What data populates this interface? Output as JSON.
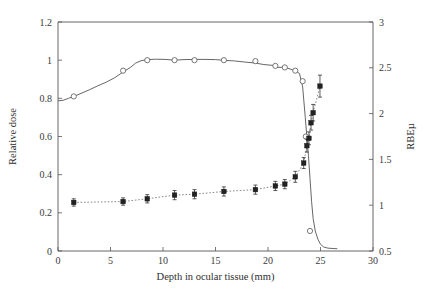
{
  "chart_data": {
    "type": "line",
    "title": "",
    "xlabel": "Depth in ocular tissue (mm)",
    "ylabel": "Relative dose",
    "y2label": "RBEµ",
    "xlim": [
      0,
      30
    ],
    "ylim": [
      0,
      1.2
    ],
    "y2lim": [
      0.5,
      3
    ],
    "xticks": [
      0,
      5,
      10,
      15,
      20,
      25,
      30
    ],
    "xticklabels": [
      "0",
      "5",
      "10",
      "15",
      "20",
      "25",
      "30"
    ],
    "yticks": [
      0,
      0.2,
      0.4,
      0.6,
      0.8,
      1,
      1.2
    ],
    "yticklabels": [
      "0",
      "0.2",
      "0.4",
      "0.6",
      "0.8",
      "1",
      "1.2"
    ],
    "y2ticks": [
      0.5,
      1,
      1.5,
      2,
      2.5,
      3
    ],
    "y2ticklabels": [
      "0.5",
      "1",
      "1.5",
      "2",
      "2.5",
      "3"
    ],
    "grid": false,
    "legend": "none",
    "series": [
      {
        "name": "Relative depth dose (SOBP)",
        "axis": "left",
        "style": "solid-line",
        "marker": "open-circle",
        "x": [
          0.0,
          0.5,
          1.0,
          1.6,
          2.2,
          3.0,
          3.8,
          4.6,
          5.4,
          6.2,
          6.9,
          7.4,
          7.9,
          8.5,
          9.3,
          10.2,
          11.1,
          12.0,
          13.0,
          14.0,
          15.0,
          15.8,
          16.8,
          17.8,
          18.8,
          19.6,
          20.4,
          20.9,
          21.6,
          22.2,
          22.6,
          23.0,
          23.3,
          23.55,
          23.7,
          23.85,
          24.0,
          24.15,
          24.3,
          24.5,
          24.75,
          25.0,
          25.3,
          25.7,
          26.2,
          26.6
        ],
        "y": [
          0.787,
          0.79,
          0.8,
          0.812,
          0.826,
          0.845,
          0.866,
          0.885,
          0.908,
          0.938,
          0.962,
          0.985,
          0.997,
          1.003,
          1.005,
          1.004,
          1.0,
          1.003,
          1.004,
          1.004,
          1.003,
          0.999,
          0.996,
          0.99,
          0.985,
          0.977,
          0.973,
          0.962,
          0.963,
          0.952,
          0.944,
          0.93,
          0.86,
          0.7,
          0.6,
          0.5,
          0.38,
          0.26,
          0.17,
          0.105,
          0.062,
          0.035,
          0.021,
          0.015,
          0.013,
          0.012
        ],
        "marker_x": [
          1.5,
          6.2,
          8.5,
          11.1,
          13.0,
          15.8,
          18.8,
          20.7,
          21.6,
          22.6,
          23.3,
          23.6,
          24.0
        ],
        "marker_y": [
          0.81,
          0.945,
          1.0,
          1.0,
          1.0,
          1.0,
          0.995,
          0.97,
          0.962,
          0.945,
          0.89,
          0.6,
          0.105
        ]
      },
      {
        "name": "RBEµ measurements",
        "axis": "right",
        "style": "dotted-line",
        "marker": "filled-square",
        "x": [
          1.5,
          6.2,
          8.5,
          11.1,
          13.0,
          15.8,
          18.8,
          20.7,
          21.6,
          22.6,
          23.4,
          23.7,
          23.9,
          24.1,
          24.3,
          24.95
        ],
        "y_left_equiv": [
          0.253,
          0.258,
          0.275,
          0.293,
          0.3,
          0.31,
          0.323,
          0.342,
          0.352,
          0.39,
          0.463,
          0.555,
          0.59,
          0.675,
          0.725,
          0.865
        ],
        "rbe": [
          1.03,
          1.04,
          1.07,
          1.11,
          1.12,
          1.15,
          1.17,
          1.21,
          1.23,
          1.31,
          1.46,
          1.65,
          1.73,
          1.9,
          2.01,
          2.3
        ],
        "rbe_err": [
          0.04,
          0.04,
          0.045,
          0.05,
          0.05,
          0.05,
          0.05,
          0.05,
          0.05,
          0.06,
          0.06,
          0.07,
          0.07,
          0.08,
          0.09,
          0.12
        ]
      }
    ]
  },
  "colors": {
    "background": "#ffffff",
    "axis": "#555555",
    "dose_curve": "#4a4a4a",
    "rbe_marker": "#222222",
    "text": "#3a3a3a"
  }
}
